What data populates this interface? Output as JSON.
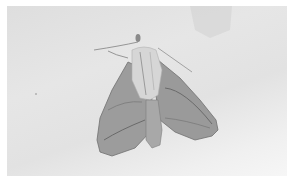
{
  "image": {
    "subject": "moth resting on pale surface",
    "style": "grayscale photograph",
    "colors": {
      "background": "#e4e4e4",
      "wing": "#9a9a9a",
      "wing_dark": "#6e6e6e",
      "thorax": "#d4d4d4",
      "border": "#ffffff"
    }
  }
}
